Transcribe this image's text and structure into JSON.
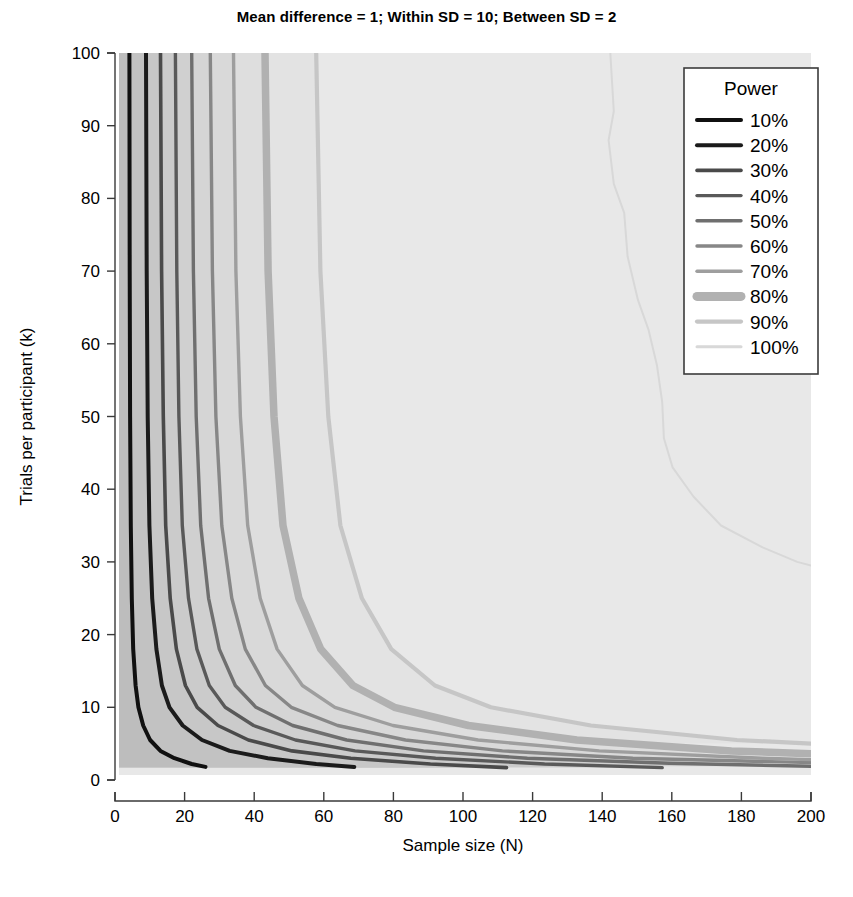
{
  "chart_data": {
    "type": "line",
    "title": "Mean difference = 1; Within SD = 10; Between SD = 2",
    "xlabel": "Sample size (N)",
    "ylabel": "Trials per participant (k)",
    "xlim": [
      0,
      200
    ],
    "ylim": [
      0,
      100
    ],
    "xticks": [
      0,
      20,
      40,
      60,
      80,
      100,
      120,
      140,
      160,
      180,
      200
    ],
    "yticks": [
      0,
      10,
      20,
      30,
      40,
      50,
      60,
      70,
      80,
      90,
      100
    ],
    "grid": false,
    "legend_position": "top-right",
    "legend_title": "Power",
    "plot_style": "filled-contour",
    "series": [
      {
        "name": "10%",
        "power": 10,
        "color": "#101010",
        "linewidth": 4.0,
        "points": [
          [
            3.0,
            100
          ],
          [
            3.1,
            70
          ],
          [
            3.2,
            50
          ],
          [
            3.4,
            35
          ],
          [
            3.7,
            25
          ],
          [
            4.1,
            18
          ],
          [
            4.8,
            13
          ],
          [
            5.6,
            10
          ],
          [
            7.0,
            7.5
          ],
          [
            9.0,
            5.5
          ],
          [
            12.0,
            4.0
          ],
          [
            16.0,
            3.0
          ],
          [
            21.0,
            2.2
          ],
          [
            25.0,
            1.8
          ]
        ]
      },
      {
        "name": "20%",
        "power": 20,
        "color": "#1b1b1b",
        "linewidth": 4.0,
        "points": [
          [
            7.8,
            100
          ],
          [
            8.0,
            70
          ],
          [
            8.3,
            50
          ],
          [
            8.8,
            35
          ],
          [
            9.6,
            25
          ],
          [
            10.8,
            18
          ],
          [
            12.4,
            13
          ],
          [
            14.6,
            10
          ],
          [
            18.4,
            7.5
          ],
          [
            24.0,
            5.5
          ],
          [
            32.0,
            4.0
          ],
          [
            43.0,
            3.0
          ],
          [
            57.0,
            2.2
          ],
          [
            68.0,
            1.8
          ]
        ]
      },
      {
        "name": "30%",
        "power": 30,
        "color": "#4a4a4a",
        "linewidth": 3.6,
        "points": [
          [
            12.0,
            100
          ],
          [
            12.3,
            70
          ],
          [
            12.8,
            50
          ],
          [
            13.5,
            35
          ],
          [
            14.8,
            25
          ],
          [
            16.6,
            18
          ],
          [
            19.2,
            13
          ],
          [
            22.6,
            10
          ],
          [
            28.6,
            7.5
          ],
          [
            37.4,
            5.5
          ],
          [
            50.0,
            4.0
          ],
          [
            67.0,
            3.0
          ],
          [
            90.0,
            2.2
          ],
          [
            112.0,
            1.7
          ]
        ]
      },
      {
        "name": "40%",
        "power": 40,
        "color": "#595959",
        "linewidth": 3.4,
        "points": [
          [
            16.3,
            100
          ],
          [
            16.7,
            70
          ],
          [
            17.3,
            50
          ],
          [
            18.3,
            35
          ],
          [
            20.1,
            25
          ],
          [
            22.5,
            18
          ],
          [
            26.1,
            13
          ],
          [
            30.7,
            10
          ],
          [
            38.9,
            7.5
          ],
          [
            51.0,
            5.5
          ],
          [
            68.2,
            4.0
          ],
          [
            91.5,
            3.0
          ],
          [
            123.0,
            2.2
          ],
          [
            157.0,
            1.7
          ]
        ]
      },
      {
        "name": "50%",
        "power": 50,
        "color": "#6f6f6f",
        "linewidth": 3.4,
        "points": [
          [
            21.0,
            100
          ],
          [
            21.5,
            70
          ],
          [
            22.3,
            50
          ],
          [
            23.6,
            35
          ],
          [
            25.9,
            25
          ],
          [
            29.0,
            18
          ],
          [
            33.6,
            13
          ],
          [
            39.6,
            10
          ],
          [
            50.2,
            7.5
          ],
          [
            65.8,
            5.5
          ],
          [
            88.0,
            4.0
          ],
          [
            118.0,
            3.0
          ],
          [
            159.0,
            2.3
          ],
          [
            200.0,
            1.9
          ]
        ]
      },
      {
        "name": "60%",
        "power": 60,
        "color": "#878787",
        "linewidth": 3.4,
        "points": [
          [
            26.4,
            100
          ],
          [
            27.0,
            70
          ],
          [
            28.0,
            50
          ],
          [
            29.7,
            35
          ],
          [
            32.6,
            25
          ],
          [
            36.5,
            18
          ],
          [
            42.3,
            13
          ],
          [
            49.8,
            10
          ],
          [
            63.2,
            7.5
          ],
          [
            82.8,
            5.5
          ],
          [
            110.8,
            4.0
          ],
          [
            148.5,
            3.0
          ],
          [
            200.0,
            2.4
          ]
        ]
      },
      {
        "name": "70%",
        "power": 70,
        "color": "#9e9e9e",
        "linewidth": 3.4,
        "points": [
          [
            33.1,
            100
          ],
          [
            33.8,
            70
          ],
          [
            35.1,
            50
          ],
          [
            37.2,
            35
          ],
          [
            40.8,
            25
          ],
          [
            45.7,
            18
          ],
          [
            53.0,
            13
          ],
          [
            62.4,
            10
          ],
          [
            79.2,
            7.5
          ],
          [
            103.8,
            5.5
          ],
          [
            138.8,
            4.0
          ],
          [
            186.0,
            3.0
          ],
          [
            200.0,
            2.8
          ]
        ]
      },
      {
        "name": "80%",
        "power": 80,
        "color": "#b1b1b1",
        "linewidth": 7.5,
        "points": [
          [
            42.2,
            100
          ],
          [
            43.1,
            70
          ],
          [
            44.8,
            50
          ],
          [
            47.4,
            35
          ],
          [
            52.0,
            25
          ],
          [
            58.3,
            18
          ],
          [
            67.6,
            13
          ],
          [
            79.6,
            10
          ],
          [
            101.0,
            7.5
          ],
          [
            132.3,
            5.5
          ],
          [
            177.0,
            4.0
          ],
          [
            200.0,
            3.6
          ]
        ]
      },
      {
        "name": "90%",
        "power": 90,
        "color": "#c6c6c6",
        "linewidth": 4.2,
        "points": [
          [
            57.0,
            100
          ],
          [
            58.2,
            70
          ],
          [
            60.5,
            50
          ],
          [
            64.0,
            35
          ],
          [
            70.2,
            25
          ],
          [
            78.7,
            18
          ],
          [
            91.3,
            13
          ],
          [
            107.5,
            10
          ],
          [
            136.4,
            7.5
          ],
          [
            178.6,
            5.5
          ],
          [
            200.0,
            5.0
          ]
        ]
      },
      {
        "name": "100%",
        "power": 100,
        "color": "#d8d8d8",
        "linewidth": 2.0,
        "points": [
          [
            142.0,
            100
          ],
          [
            143.0,
            92
          ],
          [
            141.5,
            88
          ],
          [
            143.0,
            82
          ],
          [
            146.0,
            78
          ],
          [
            147.0,
            72
          ],
          [
            150.0,
            66
          ],
          [
            153.0,
            62
          ],
          [
            155.5,
            57
          ],
          [
            157.0,
            52
          ],
          [
            157.5,
            47
          ],
          [
            160.0,
            43
          ],
          [
            166.0,
            39
          ],
          [
            174.0,
            35
          ],
          [
            186.0,
            32
          ],
          [
            196.0,
            30
          ],
          [
            200.0,
            29.5
          ]
        ]
      }
    ],
    "fill_bands": [
      {
        "upto": "10%",
        "color": "#bdbdbd"
      },
      {
        "upto": "20%",
        "color": "#c2c2c2"
      },
      {
        "upto": "30%",
        "color": "#c7c7c7"
      },
      {
        "upto": "40%",
        "color": "#cbcbcb"
      },
      {
        "upto": "50%",
        "color": "#d0d0d0"
      },
      {
        "upto": "60%",
        "color": "#d5d5d5"
      },
      {
        "upto": "70%",
        "color": "#d9d9d9"
      },
      {
        "upto": "80%",
        "color": "#dedede"
      },
      {
        "upto": "90%",
        "color": "#e3e3e3"
      },
      {
        "upto": "100%",
        "color": "#e8e8e8"
      }
    ]
  },
  "legend": {
    "title": "Power",
    "items": [
      {
        "label": "10%",
        "color": "#101010",
        "width": 4.0
      },
      {
        "label": "20%",
        "color": "#1b1b1b",
        "width": 4.0
      },
      {
        "label": "30%",
        "color": "#4a4a4a",
        "width": 3.6
      },
      {
        "label": "40%",
        "color": "#595959",
        "width": 3.4
      },
      {
        "label": "50%",
        "color": "#6f6f6f",
        "width": 3.4
      },
      {
        "label": "60%",
        "color": "#878787",
        "width": 3.4
      },
      {
        "label": "70%",
        "color": "#9e9e9e",
        "width": 3.4
      },
      {
        "label": "80%",
        "color": "#b1b1b1",
        "width": 9.0
      },
      {
        "label": "90%",
        "color": "#c6c6c6",
        "width": 4.2
      },
      {
        "label": "100%",
        "color": "#d8d8d8",
        "width": 3.0
      }
    ]
  }
}
